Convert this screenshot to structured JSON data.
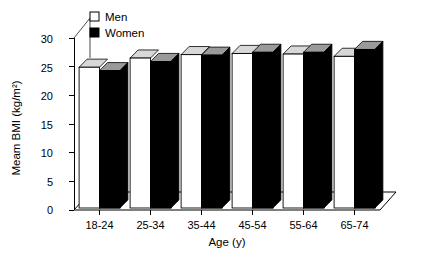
{
  "chart_data": {
    "type": "bar",
    "title": "",
    "xlabel": "Age (y)",
    "ylabel": "Meam BMI (kg/m²)",
    "categories": [
      "18-24",
      "25-34",
      "35-44",
      "45-54",
      "55-64",
      "65-74"
    ],
    "series": [
      {
        "name": "Men",
        "color": "#ffffff",
        "values": [
          24.9,
          26.5,
          27.1,
          27.3,
          27.2,
          26.8
        ]
      },
      {
        "name": "Women",
        "color": "#000000",
        "values": [
          24.3,
          25.9,
          27.0,
          27.5,
          27.5,
          28.0
        ]
      }
    ],
    "ylim": [
      0,
      32
    ],
    "yticks": [
      0,
      5,
      10,
      15,
      20,
      25,
      30
    ],
    "ytick_labels": [
      "0",
      "5",
      "10",
      "15",
      "20",
      "25",
      "30"
    ],
    "grid": false,
    "legend_position": "top-left",
    "style": "3d-perspective"
  },
  "legend": {
    "entries": [
      {
        "label": "Men",
        "swatch": "open-square-icon"
      },
      {
        "label": "Women",
        "swatch": "filled-square-icon"
      }
    ]
  },
  "axes": {
    "y_title": "Meam BMI (kg/m²)",
    "x_title": "Age (y)"
  }
}
